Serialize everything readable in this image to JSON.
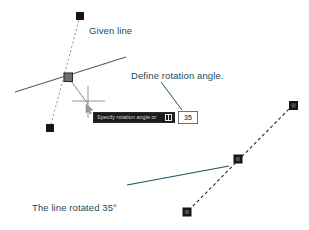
{
  "diagram": {
    "colors": {
      "annotation_text": "#1d4a57",
      "leader_line": "#1d5360",
      "original_line": "#5a5a5a",
      "construction_dashed": "#8a8a8a",
      "rotated_dashed": "#2a2a2a",
      "grip_fill": "#151515",
      "hot_grip_fill": "#6f6f6f",
      "cursor": "#6b6b6b",
      "prompt_bg": "#1c1c1c",
      "prompt_text": "#d8d8d8",
      "input_border": "#6e6e6e"
    },
    "annotations": {
      "given_line": "Given line",
      "define_angle": "Define rotation angle.",
      "rotated_line_1": "The line rotated 35°",
      "rotated_line_2": "about its midpoint"
    },
    "prompt": {
      "text": "Specify rotation angle or",
      "expand_icon": "expand-options-icon"
    },
    "angle_input": {
      "value": "35",
      "placeholder": "35"
    },
    "geometry": {
      "original_line": {
        "x1": 15,
        "y1": 92,
        "x2": 126,
        "y2": 57
      },
      "rubber_band_dashed": {
        "x1": 80,
        "y1": 16,
        "x2": 50,
        "y2": 128
      },
      "rotated_line_dashed": {
        "x1": 293,
        "y1": 105,
        "x2": 187,
        "y2": 212
      },
      "grips": [
        {
          "name": "grip-original-top",
          "x": 80,
          "y": 16,
          "type": "cold"
        },
        {
          "name": "grip-original-bottom",
          "x": 50,
          "y": 128,
          "type": "cold"
        },
        {
          "name": "grip-original-midpoint",
          "x": 68,
          "y": 77,
          "type": "hot"
        },
        {
          "name": "grip-rotated-top",
          "x": 293,
          "y": 105,
          "type": "cold"
        },
        {
          "name": "grip-rotated-midpoint",
          "x": 238,
          "y": 159,
          "type": "hot"
        },
        {
          "name": "grip-rotated-bottom",
          "x": 187,
          "y": 212,
          "type": "cold"
        }
      ],
      "cursor": {
        "x": 88,
        "y": 101
      },
      "leaders": [
        {
          "name": "leader-define-angle",
          "x1": 160,
          "y1": 82,
          "x2": 181,
          "y2": 110
        },
        {
          "name": "leader-rotated-line",
          "x1": 127,
          "y1": 184,
          "x2": 229,
          "y2": 166
        }
      ]
    }
  }
}
